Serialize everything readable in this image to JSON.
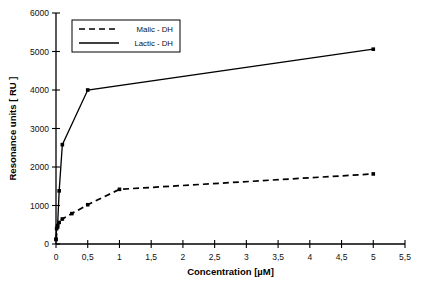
{
  "chart_data": {
    "type": "line",
    "title": "",
    "xlabel": "Concentration [µM]",
    "ylabel": "Resonance units  [ RU ]",
    "xlim": [
      0,
      5.5
    ],
    "ylim": [
      0,
      6000
    ],
    "grid": false,
    "legend_position": "top-left",
    "x_tick_labels": [
      "0",
      "0,5",
      "1",
      "1,5",
      "2",
      "2,5",
      "3",
      "3,5",
      "4",
      "4,5",
      "5",
      "5,5"
    ],
    "x_tick_values": [
      0,
      0.5,
      1,
      1.5,
      2,
      2.5,
      3,
      3.5,
      4,
      4.5,
      5,
      5.5
    ],
    "y_tick_labels": [
      "0",
      "1000",
      "2000",
      "3000",
      "4000",
      "5000",
      "6000"
    ],
    "y_tick_values": [
      0,
      1000,
      2000,
      3000,
      4000,
      5000,
      6000
    ],
    "series": [
      {
        "name": "Malic - DH",
        "style": "dashed",
        "marker": "square",
        "color": "#000000",
        "points": [
          {
            "x": 0,
            "y": 120
          },
          {
            "x": 0.025,
            "y": 440
          },
          {
            "x": 0.05,
            "y": 560
          },
          {
            "x": 0.1,
            "y": 650
          },
          {
            "x": 0.25,
            "y": 790
          },
          {
            "x": 0.5,
            "y": 1020
          },
          {
            "x": 1,
            "y": 1420
          },
          {
            "x": 5,
            "y": 1820
          }
        ]
      },
      {
        "name": "Lactic - DH",
        "style": "solid",
        "marker": "square",
        "color": "#000000",
        "points": [
          {
            "x": 0,
            "y": 120
          },
          {
            "x": 0.01,
            "y": 400
          },
          {
            "x": 0.025,
            "y": 480
          },
          {
            "x": 0.05,
            "y": 1380
          },
          {
            "x": 0.1,
            "y": 2580
          },
          {
            "x": 0.5,
            "y": 4000
          },
          {
            "x": 5,
            "y": 5060
          }
        ]
      }
    ]
  },
  "legend": {
    "entries": [
      {
        "label": "Malic - DH"
      },
      {
        "label": "Lactic - DH"
      }
    ]
  },
  "axes": {
    "x_title": "Concentration [µM]",
    "y_title": "Resonance units  [ RU ]"
  }
}
